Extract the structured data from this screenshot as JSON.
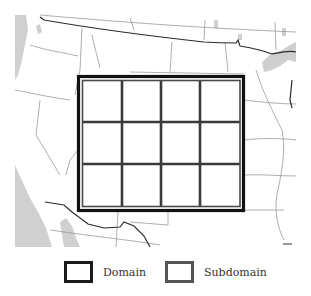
{
  "figure": {
    "type": "map-grid-diagram",
    "region": "Western / Central United States",
    "grid": {
      "rows": 3,
      "cols": 4
    },
    "colors": {
      "domain_border": "#1a1a1a",
      "subdomain_border": "#444444",
      "water": "#cfcfcf",
      "state_lines": "#9a9a9a",
      "national_border": "#2b2b2b"
    }
  },
  "legend": {
    "items": [
      {
        "label": "Domain",
        "style": "thick-black-box"
      },
      {
        "label": "Subdomain",
        "style": "gray-box"
      }
    ]
  }
}
